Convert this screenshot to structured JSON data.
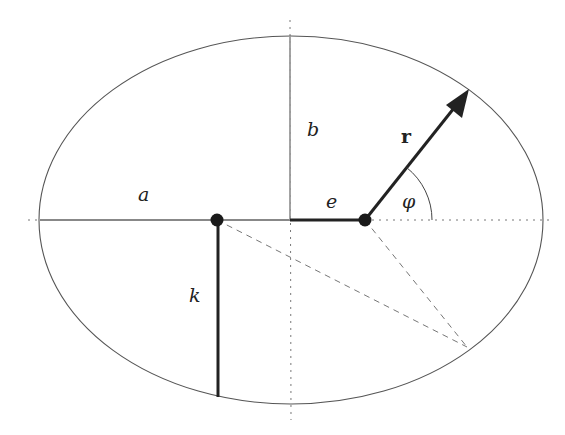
{
  "diagram": {
    "colors": {
      "background": "#ffffff",
      "ellipse": "#555555",
      "axis_solid": "#888888",
      "thick": "#222222",
      "dashed": "#666666",
      "dotted": "#777777"
    },
    "ellipse": {
      "cx": 291,
      "cy": 220,
      "rx": 252,
      "ry": 184
    },
    "foci": [
      {
        "name": "left-focus",
        "x": 217,
        "y": 220
      },
      {
        "name": "right-focus",
        "x": 365,
        "y": 220
      }
    ],
    "labels": {
      "a": "a",
      "b": "b",
      "e": "e",
      "r": "r",
      "phi": "φ",
      "k": "k"
    },
    "segments": {
      "semi_major_a": {
        "x1": 40,
        "y1": 220,
        "x2": 291,
        "y2": 220
      },
      "semi_minor_b": {
        "x1": 290,
        "y1": 36,
        "x2": 290,
        "y2": 220
      },
      "eccentricity_e": {
        "x1": 290,
        "y1": 220,
        "x2": 365,
        "y2": 220
      },
      "radius_r": {
        "x1": 365,
        "y1": 220,
        "x2": 469,
        "y2": 89
      },
      "semi_latus_k": {
        "x1": 218,
        "y1": 220,
        "x2": 218,
        "y2": 397
      }
    },
    "dashed_point": {
      "x": 467,
      "y": 347
    },
    "angle_arc": {
      "radius": 67
    }
  }
}
